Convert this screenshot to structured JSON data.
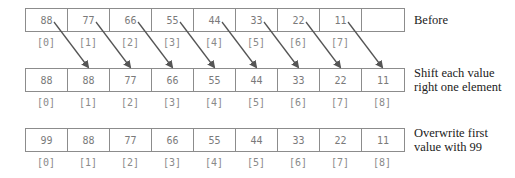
{
  "rows": [
    {
      "id": "before",
      "values": [
        "88",
        "77",
        "66",
        "55",
        "44",
        "33",
        "22",
        "11",
        ""
      ],
      "indices": [
        "[0]",
        "[1]",
        "[2]",
        "[3]",
        "[4]",
        "[5]",
        "[6]",
        "[7]"
      ],
      "label_lines": [
        "Before"
      ]
    },
    {
      "id": "shift",
      "values": [
        "88",
        "88",
        "77",
        "66",
        "55",
        "44",
        "33",
        "22",
        "11"
      ],
      "indices": [
        "[0]",
        "[1]",
        "[2]",
        "[3]",
        "[4]",
        "[5]",
        "[6]",
        "[7]",
        "[8]"
      ],
      "label_lines": [
        "Shift each value",
        "right one element"
      ]
    },
    {
      "id": "overwrite",
      "values": [
        "99",
        "88",
        "77",
        "66",
        "55",
        "44",
        "33",
        "22",
        "11"
      ],
      "indices": [
        "[0]",
        "[1]",
        "[2]",
        "[3]",
        "[4]",
        "[5]",
        "[6]",
        "[7]",
        "[8]"
      ],
      "label_lines": [
        "Overwrite first",
        "value with 99"
      ]
    }
  ],
  "arrows": {
    "description": "Each element i (0-7) of 'Before' row points to element i+1 of 'Shift' row",
    "from_indices": [
      0,
      1,
      2,
      3,
      4,
      5,
      6,
      7
    ],
    "to_indices": [
      1,
      2,
      3,
      4,
      5,
      6,
      7,
      8
    ]
  },
  "colors": {
    "cell_border": "#8c8c8c",
    "cell_text": "#7a7a7a",
    "arrow": "#555555",
    "label_text": "#222222"
  }
}
